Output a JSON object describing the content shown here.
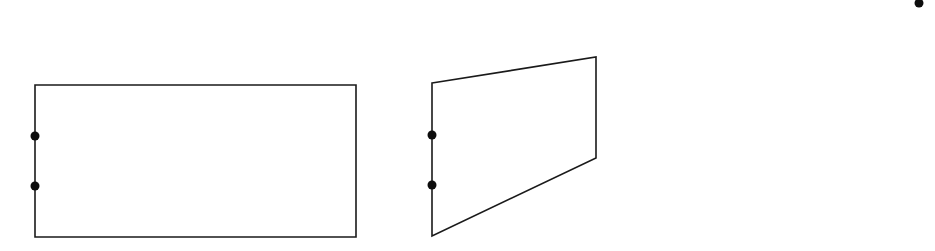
{
  "canvas": {
    "width": 935,
    "height": 251,
    "background": "#ffffff"
  },
  "style": {
    "stroke": "#1a1a1a",
    "dot_fill": "#0d0d0d",
    "stroke_width": 1.6,
    "dot_radius": 4.5
  },
  "shapes": {
    "rectangle": {
      "label": "",
      "points": "35,85 356,85 356,237 35,237",
      "dots": [
        {
          "cx": 35,
          "cy": 136
        },
        {
          "cx": 35,
          "cy": 186
        }
      ]
    },
    "quadrilateral": {
      "label": "",
      "points": "432,83 596,57 596,158 432,236",
      "dots": [
        {
          "cx": 432,
          "cy": 135
        },
        {
          "cx": 432,
          "cy": 185
        }
      ]
    },
    "corner_dot": {
      "cx": 919,
      "cy": 3
    }
  }
}
